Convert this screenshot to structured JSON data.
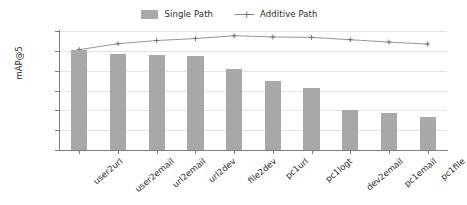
{
  "chart_data": {
    "type": "bar",
    "title": "",
    "xlabel": "",
    "ylabel": "mAP@5",
    "ylim": [
      0.7,
      1.0
    ],
    "yticks": [
      "1.00",
      "0.95",
      "0.90",
      "0.85",
      "0.80",
      "0.75",
      "0.70"
    ],
    "ytick_values": [
      1.0,
      0.95,
      0.9,
      0.85,
      0.8,
      0.75,
      0.7
    ],
    "grid": true,
    "legend_position": "top-center",
    "categories": [
      "user2url",
      "user2email",
      "url2email",
      "url2dev",
      "file2dev",
      "pc1url",
      "pc1logt",
      "dev2email",
      "pc1email",
      "pc1file"
    ],
    "series": [
      {
        "name": "Single Path",
        "kind": "bar",
        "color": "#a8a8a8",
        "values": [
          0.953,
          0.942,
          0.94,
          0.938,
          0.903,
          0.875,
          0.856,
          0.8,
          0.794,
          0.783
        ]
      },
      {
        "name": "Additive Path",
        "kind": "line",
        "color": "#8a8a8a",
        "marker": "plus-marker",
        "values": [
          0.953,
          0.968,
          0.976,
          0.981,
          0.988,
          0.985,
          0.984,
          0.978,
          0.972,
          0.967
        ]
      }
    ]
  },
  "legend": {
    "items": [
      {
        "label": "Single Path",
        "icon": "bar-swatch-icon"
      },
      {
        "label": "Additive Path",
        "icon": "line-plus-marker-icon"
      }
    ]
  }
}
